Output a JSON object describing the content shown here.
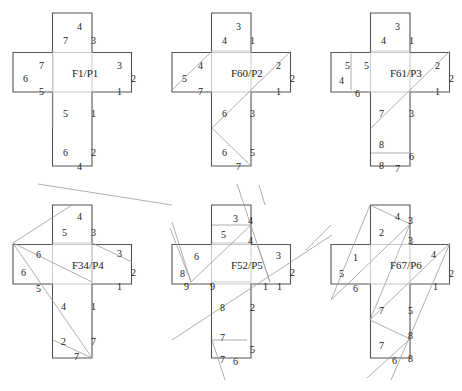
{
  "figure": {
    "nets": [
      {
        "title": "F1/P1",
        "origin": [
          13,
          13
        ],
        "title_pos": [
          73,
          74
        ],
        "inner_lines": [
          [
            40,
            38,
            40,
            115
          ]
        ],
        "fold_lines": [],
        "labels": [
          {
            "t": "4",
            "x": 60,
            "y": 8
          },
          {
            "t": "7",
            "x": 46,
            "y": 22
          },
          {
            "t": "3",
            "x": 74,
            "y": 22
          },
          {
            "t": "7",
            "x": 22,
            "y": 47
          },
          {
            "t": "6",
            "x": 6,
            "y": 60
          },
          {
            "t": "5",
            "x": 22,
            "y": 73
          },
          {
            "t": "3",
            "x": 100,
            "y": 47
          },
          {
            "t": "2",
            "x": 114,
            "y": 60
          },
          {
            "t": "1",
            "x": 100,
            "y": 73
          },
          {
            "t": "5",
            "x": 46,
            "y": 95
          },
          {
            "t": "1",
            "x": 74,
            "y": 95
          },
          {
            "t": "6",
            "x": 46,
            "y": 134
          },
          {
            "t": "2",
            "x": 74,
            "y": 134
          },
          {
            "t": "4",
            "x": 60,
            "y": 148
          }
        ]
      },
      {
        "title": "F60/P2",
        "origin": [
          172,
          13
        ],
        "title_pos": [
          73,
          74
        ],
        "inner_lines": [
          [
            40,
            38,
            79,
            38
          ]
        ],
        "fold_lines": [
          [
            0,
            77,
            40,
            38
          ],
          [
            119,
            38,
            40,
            115
          ],
          [
            40,
            115,
            79,
            153
          ]
        ],
        "labels": [
          {
            "t": "3",
            "x": 60,
            "y": 8
          },
          {
            "t": "4",
            "x": 46,
            "y": 22
          },
          {
            "t": "1",
            "x": 74,
            "y": 22
          },
          {
            "t": "4",
            "x": 22,
            "y": 47
          },
          {
            "t": "5",
            "x": 6,
            "y": 60
          },
          {
            "t": "7",
            "x": 22,
            "y": 73
          },
          {
            "t": "2",
            "x": 100,
            "y": 47
          },
          {
            "t": "2",
            "x": 114,
            "y": 60
          },
          {
            "t": "1",
            "x": 100,
            "y": 73
          },
          {
            "t": "6",
            "x": 46,
            "y": 95
          },
          {
            "t": "3",
            "x": 74,
            "y": 95
          },
          {
            "t": "6",
            "x": 46,
            "y": 134
          },
          {
            "t": "5",
            "x": 74,
            "y": 134
          },
          {
            "t": "7",
            "x": 60,
            "y": 148
          }
        ],
        "external_lines": [
          [
            87,
            172,
            93,
            192
          ]
        ]
      },
      {
        "title": "F61/P3",
        "origin": [
          331,
          13
        ],
        "title_pos": [
          73,
          74
        ],
        "inner_lines": [
          [
            40,
            38,
            79,
            38
          ]
        ],
        "fold_lines": [
          [
            20,
            38,
            20,
            77
          ],
          [
            119,
            38,
            40,
            115
          ],
          [
            40,
            140,
            79,
            140
          ]
        ],
        "labels": [
          {
            "t": "3",
            "x": 60,
            "y": 8
          },
          {
            "t": "4",
            "x": 46,
            "y": 22
          },
          {
            "t": "1",
            "x": 74,
            "y": 22
          },
          {
            "t": "5",
            "x": 10,
            "y": 47
          },
          {
            "t": "5",
            "x": 29,
            "y": 47
          },
          {
            "t": "4",
            "x": 4,
            "y": 62
          },
          {
            "t": "6",
            "x": 20,
            "y": 75
          },
          {
            "t": "2",
            "x": 100,
            "y": 47
          },
          {
            "t": "2",
            "x": 114,
            "y": 60
          },
          {
            "t": "1",
            "x": 100,
            "y": 73
          },
          {
            "t": "7",
            "x": 44,
            "y": 95
          },
          {
            "t": "3",
            "x": 74,
            "y": 95
          },
          {
            "t": "8",
            "x": 44,
            "y": 126
          },
          {
            "t": "6",
            "x": 74,
            "y": 138
          },
          {
            "t": "8",
            "x": 44,
            "y": 147
          },
          {
            "t": "7",
            "x": 60,
            "y": 150
          }
        ]
      },
      {
        "title": "F34/P4",
        "origin": [
          13,
          205
        ],
        "title_pos": [
          73,
          74
        ],
        "inner_lines": [
          [
            40,
            38,
            79,
            38
          ],
          [
            79,
            38,
            79,
            77
          ]
        ],
        "fold_lines": [
          [
            0,
            38,
            59,
            0
          ],
          [
            0,
            38,
            79,
            77
          ],
          [
            0,
            38,
            79,
            153
          ],
          [
            79,
            38,
            119,
            57
          ],
          [
            40,
            135,
            79,
            153
          ]
        ],
        "labels": [
          {
            "t": "4",
            "x": 60,
            "y": 6
          },
          {
            "t": "5",
            "x": 45,
            "y": 22
          },
          {
            "t": "3",
            "x": 74,
            "y": 22
          },
          {
            "t": "6",
            "x": 19,
            "y": 44
          },
          {
            "t": "6",
            "x": 4,
            "y": 62
          },
          {
            "t": "5",
            "x": 19,
            "y": 78
          },
          {
            "t": "3",
            "x": 100,
            "y": 43
          },
          {
            "t": "2",
            "x": 114,
            "y": 62
          },
          {
            "t": "1",
            "x": 100,
            "y": 76
          },
          {
            "t": "4",
            "x": 44,
            "y": 96
          },
          {
            "t": "1",
            "x": 74,
            "y": 96
          },
          {
            "t": "2",
            "x": 44,
            "y": 131
          },
          {
            "t": "7",
            "x": 74,
            "y": 131
          },
          {
            "t": "7",
            "x": 57,
            "y": 146
          }
        ]
      },
      {
        "title": "F52/P5",
        "origin": [
          172,
          205
        ],
        "title_pos": [
          73,
          74
        ],
        "inner_lines": [
          [
            40,
            38,
            79,
            38
          ],
          [
            40,
            77,
            79,
            77
          ]
        ],
        "fold_lines": [
          [
            40,
            20,
            79,
            20
          ],
          [
            19,
            77,
            79,
            20
          ],
          [
            0,
            17,
            19,
            77
          ],
          [
            -134,
            -21,
            0,
            0
          ],
          [
            65,
            -21,
            98,
            77
          ],
          [
            40,
            135,
            75,
            135
          ]
        ],
        "labels": [
          {
            "t": "3",
            "x": 57,
            "y": 8
          },
          {
            "t": "4",
            "x": 72,
            "y": 10
          },
          {
            "t": "5",
            "x": 45,
            "y": 24
          },
          {
            "t": "4",
            "x": 72,
            "y": 30
          },
          {
            "t": "6",
            "x": 18,
            "y": 46
          },
          {
            "t": "8",
            "x": 4,
            "y": 63
          },
          {
            "t": "9",
            "x": 8,
            "y": 76
          },
          {
            "t": "9",
            "x": 34,
            "y": 76
          },
          {
            "t": "3",
            "x": 100,
            "y": 45
          },
          {
            "t": "2",
            "x": 114,
            "y": 62
          },
          {
            "t": "1",
            "x": 87,
            "y": 76
          },
          {
            "t": "1",
            "x": 101,
            "y": 76
          },
          {
            "t": "8",
            "x": 44,
            "y": 97
          },
          {
            "t": "2",
            "x": 74,
            "y": 97
          },
          {
            "t": "7",
            "x": 44,
            "y": 127
          },
          {
            "t": "5",
            "x": 74,
            "y": 139
          },
          {
            "t": "7",
            "x": 44,
            "y": 149
          },
          {
            "t": "6",
            "x": 57,
            "y": 151
          }
        ],
        "external_lines": [
          [
            0,
            135,
            160,
            30
          ],
          [
            40,
            135,
            53,
            175
          ],
          [
            -2,
            23,
            19,
            77
          ],
          [
            98,
            77,
            85,
            39
          ]
        ]
      },
      {
        "title": "F67/P6",
        "origin": [
          331,
          205
        ],
        "title_pos": [
          73,
          74
        ],
        "inner_lines": [],
        "fold_lines": [
          [
            39,
            0,
            79,
            19
          ],
          [
            79,
            19,
            0,
            95
          ],
          [
            39,
            0,
            0,
            95
          ],
          [
            79,
            19,
            39,
            115
          ],
          [
            119,
            38,
            39,
            115
          ],
          [
            119,
            38,
            60,
            175
          ],
          [
            39,
            115,
            79,
            134
          ],
          [
            79,
            134,
            36,
            173
          ]
        ],
        "labels": [
          {
            "t": "4",
            "x": 60,
            "y": 6
          },
          {
            "t": "3",
            "x": 73,
            "y": 10
          },
          {
            "t": "2",
            "x": 44,
            "y": 22
          },
          {
            "t": "3",
            "x": 73,
            "y": 30
          },
          {
            "t": "1",
            "x": 18,
            "y": 47
          },
          {
            "t": "5",
            "x": 4,
            "y": 63
          },
          {
            "t": "6",
            "x": 18,
            "y": 78
          },
          {
            "t": "4",
            "x": 96,
            "y": 44
          },
          {
            "t": "2",
            "x": 114,
            "y": 63
          },
          {
            "t": "1",
            "x": 98,
            "y": 76
          },
          {
            "t": "7",
            "x": 44,
            "y": 100
          },
          {
            "t": "5",
            "x": 73,
            "y": 100
          },
          {
            "t": "8",
            "x": 73,
            "y": 125
          },
          {
            "t": "7",
            "x": 44,
            "y": 135
          },
          {
            "t": "8",
            "x": 73,
            "y": 148
          },
          {
            "t": "6",
            "x": 57,
            "y": 150
          }
        ],
        "external_lines": [
          [
            -25,
            45,
            0,
            20
          ]
        ]
      }
    ],
    "geometry": {
      "cell": 39.5,
      "stroke": "#555555",
      "line_color": "#9a9a9a"
    }
  }
}
